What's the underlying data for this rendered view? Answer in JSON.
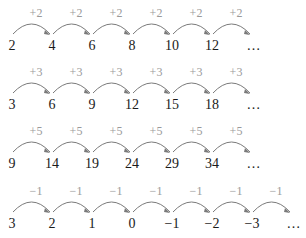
{
  "colors": {
    "number": "#1a1a1a",
    "label": "#9a9a9a",
    "arc": "#7a7a7a"
  },
  "rows": [
    {
      "step": "+2",
      "numbers": [
        "2",
        "4",
        "6",
        "8",
        "10",
        "12"
      ],
      "ellipsis": "…",
      "top": 0
    },
    {
      "step": "+3",
      "numbers": [
        "3",
        "6",
        "9",
        "12",
        "15",
        "18"
      ],
      "ellipsis": "…",
      "top": 59
    },
    {
      "step": "+5",
      "numbers": [
        "9",
        "14",
        "19",
        "24",
        "29",
        "34"
      ],
      "ellipsis": "…",
      "top": 118
    },
    {
      "step": "−1",
      "numbers": [
        "3",
        "2",
        "1",
        "0",
        "−1",
        "−2",
        "−3"
      ],
      "ellipsis": "…",
      "top": 178
    }
  ]
}
